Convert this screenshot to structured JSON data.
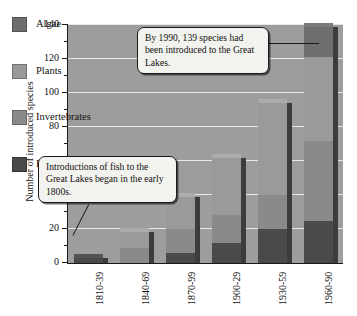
{
  "chart_data": {
    "type": "bar",
    "subtype": "stacked-bar",
    "title": "",
    "xlabel": "",
    "ylabel": "Number of introduced species",
    "ylim": [
      0,
      140
    ],
    "ytick_step": 20,
    "yticks": [
      0,
      20,
      40,
      60,
      80,
      100,
      120,
      140
    ],
    "ytick_labels": [
      "0",
      "20",
      "40",
      "60",
      "80",
      "100",
      "120",
      "140"
    ],
    "grid": true,
    "grid_axis": "y",
    "legend_position": "upper-left-inside",
    "categories": [
      "1810-39",
      "1840-69",
      "1870-99",
      "1900-29",
      "1930-59",
      "1960-90"
    ],
    "series": [
      {
        "name": "Fish",
        "color": "#4a4a4a",
        "values": [
          3,
          0,
          6,
          12,
          20,
          25
        ]
      },
      {
        "name": "Invertebrates",
        "color": "#8a8a8a",
        "values": [
          0,
          9,
          14,
          16,
          20,
          47
        ]
      },
      {
        "name": "Plants",
        "color": "#9a9a9a",
        "values": [
          0,
          9,
          19,
          34,
          54,
          49
        ]
      },
      {
        "name": "Algae",
        "color": "#6e6e6e",
        "values": [
          0,
          0,
          0,
          0,
          0,
          18
        ]
      }
    ],
    "totals": [
      3,
      18,
      39,
      62,
      94,
      139
    ],
    "annotations": [
      "By 1990, 139 species had been introduced to the Great Lakes.",
      "Introductions of fish to the Great Lakes began in the early 1800s."
    ]
  },
  "legend": {
    "items": [
      {
        "label": "Algae",
        "color": "#6e6e6e"
      },
      {
        "label": "Plants",
        "color": "#9a9a9a"
      },
      {
        "label": "Invertebrates",
        "color": "#8a8a8a"
      },
      {
        "label": "Fish",
        "color": "#4a4a4a"
      }
    ]
  },
  "callouts": [
    {
      "id": "callout-1990",
      "text": "By 1990, 139 species had been introduced to the Great Lakes."
    },
    {
      "id": "callout-fish",
      "text": "Introductions of fish to the Great Lakes began in the early 1800s."
    }
  ],
  "colors": {
    "plot_background": "#9d9d9d",
    "gridline": "#e8e8e8",
    "axis": "#1a1a1a",
    "bar_side": "#3c3c3c",
    "callout_background": "#f2f2ee"
  }
}
